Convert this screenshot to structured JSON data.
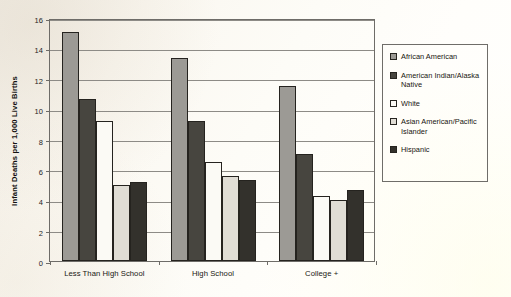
{
  "chart_data": {
    "type": "bar",
    "title": "",
    "xlabel": "",
    "ylabel": "Infant Deaths  per 1,000 Live Births",
    "ylim": [
      0,
      16
    ],
    "ytick_labels": [
      "0",
      "2",
      "4",
      "6",
      "8",
      "10",
      "12",
      "14",
      "16"
    ],
    "ytick_values": [
      0,
      2,
      4,
      6,
      8,
      10,
      12,
      14,
      16
    ],
    "grid": true,
    "legend_position": "right",
    "categories": [
      "Less Than High School",
      "High School",
      "College +"
    ],
    "series": [
      {
        "name": "African American",
        "color": "#9c9a95",
        "values": [
          15.1,
          13.35,
          11.55
        ]
      },
      {
        "name": "American Indian/Alaska Native",
        "color": "#47453f",
        "values": [
          10.7,
          9.2,
          7.05
        ]
      },
      {
        "name": "White",
        "color": "#fbfaf5",
        "values": [
          9.2,
          6.5,
          4.25
        ]
      },
      {
        "name": "Asian American/Pacific Islander",
        "color": "#e0ddd5",
        "values": [
          5.0,
          5.6,
          4.0
        ]
      },
      {
        "name": "Hispanic",
        "color": "#33312c",
        "values": [
          5.2,
          5.35,
          4.65
        ]
      }
    ]
  },
  "legend": {
    "entries": [
      {
        "label": "African American"
      },
      {
        "label": "American Indian/Alaska Native"
      },
      {
        "label": "White"
      },
      {
        "label": "Asian American/Pacific Islander"
      },
      {
        "label": "Hispanic"
      }
    ]
  },
  "colors": {
    "axis": "#6e6c68",
    "gridline": "#8d8b86",
    "bar_outline": "#25231f",
    "text": "#17150f",
    "background": "#fdfbf5"
  }
}
